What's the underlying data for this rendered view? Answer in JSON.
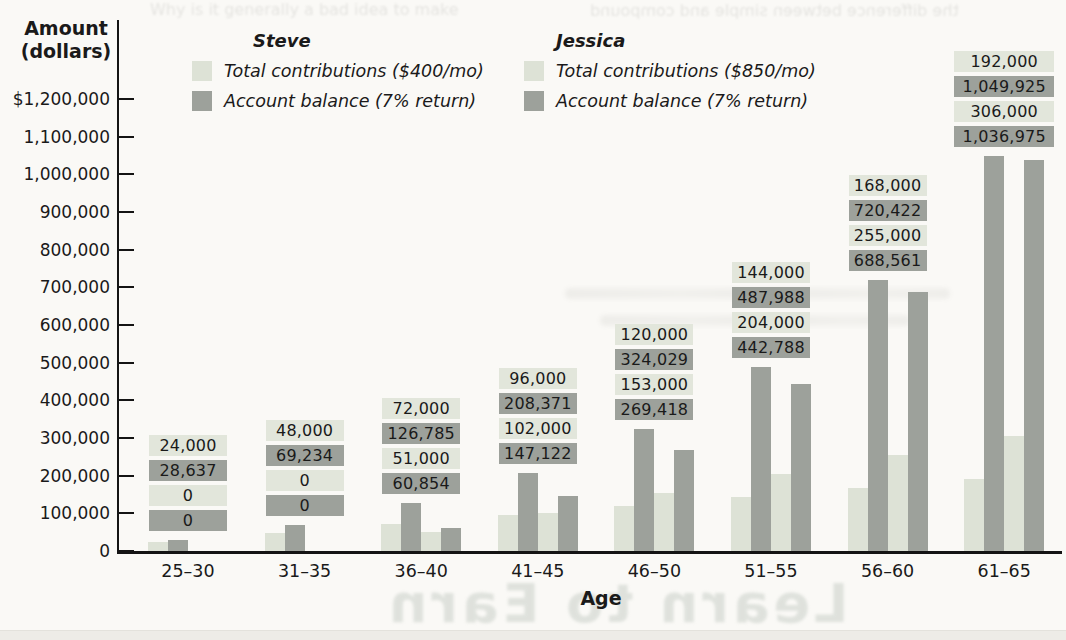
{
  "chart_data": {
    "type": "bar",
    "title": "",
    "xlabel": "Age",
    "ylabel": "Amount (dollars)",
    "ylabel_lines": [
      "Amount",
      "(dollars)"
    ],
    "ylim": [
      0,
      1200000
    ],
    "ytick_step": 100000,
    "ytick_labels": [
      "0",
      "100,000",
      "200,000",
      "300,000",
      "400,000",
      "500,000",
      "600,000",
      "700,000",
      "800,000",
      "900,000",
      "1,000,000",
      "1,100,000",
      "$1,200,000"
    ],
    "grid": false,
    "legend_position": "top",
    "categories": [
      "25–30",
      "31–35",
      "36–40",
      "41–45",
      "46–50",
      "51–55",
      "56–60",
      "61–65"
    ],
    "series": [
      {
        "person": "Steve",
        "name": "Steve – Total contributions ($400/mo)",
        "swatch": "light",
        "values": [
          24000,
          48000,
          72000,
          96000,
          120000,
          144000,
          168000,
          192000
        ],
        "value_labels": [
          "24,000",
          "48,000",
          "72,000",
          "96,000",
          "120,000",
          "144,000",
          "168,000",
          "192,000"
        ]
      },
      {
        "person": "Steve",
        "name": "Steve – Account balance (7% return)",
        "swatch": "dark",
        "values": [
          28637,
          69234,
          126785,
          208371,
          324029,
          487988,
          720422,
          1049925
        ],
        "value_labels": [
          "28,637",
          "69,234",
          "126,785",
          "208,371",
          "324,029",
          "487,988",
          "720,422",
          "1,049,925"
        ]
      },
      {
        "person": "Jessica",
        "name": "Jessica – Total contributions ($850/mo)",
        "swatch": "light",
        "values": [
          0,
          0,
          51000,
          102000,
          153000,
          204000,
          255000,
          306000
        ],
        "value_labels": [
          "0",
          "0",
          "51,000",
          "102,000",
          "153,000",
          "204,000",
          "255,000",
          "306,000"
        ]
      },
      {
        "person": "Jessica",
        "name": "Jessica – Account balance (7% return)",
        "swatch": "dark",
        "values": [
          0,
          0,
          60854,
          147122,
          269418,
          442788,
          688561,
          1036975
        ],
        "value_labels": [
          "0",
          "0",
          "60,854",
          "147,122",
          "269,418",
          "442,788",
          "688,561",
          "1,036,975"
        ]
      }
    ],
    "colors": {
      "light": "#dde2d6",
      "dark": "#9da19b",
      "light_label": "#e2e6db",
      "dark_label": "#9da19b",
      "axis": "#141414",
      "page_background": "#faf9f6"
    }
  },
  "legend": {
    "steve": {
      "name": "Steve",
      "items": [
        {
          "swatch": "light",
          "label": "Total contributions ($400/mo)"
        },
        {
          "swatch": "dark",
          "label": "Account balance (7% return)"
        }
      ]
    },
    "jessica": {
      "name": "Jessica",
      "items": [
        {
          "swatch": "light",
          "label": "Total contributions ($850/mo)"
        },
        {
          "swatch": "dark",
          "label": "Account balance (7% return)"
        }
      ]
    }
  },
  "page_artifacts": {
    "bleed_top_left": "Why is it generally a bad idea to make",
    "bleed_top_right": "the difference between simple and compound",
    "ghost_title": "Learn to Earn"
  }
}
